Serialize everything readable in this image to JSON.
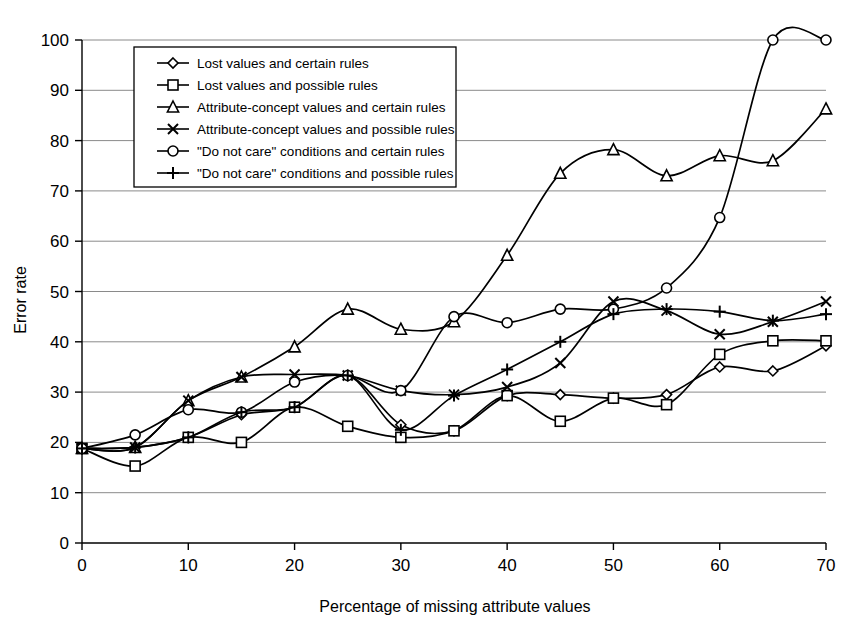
{
  "chart_data": {
    "type": "line",
    "title": "",
    "xlabel": "Percentage of missing attribute values",
    "ylabel": "Error rate",
    "xlim": [
      0,
      70
    ],
    "ylim": [
      0,
      100
    ],
    "xticks": [
      0,
      10,
      20,
      30,
      40,
      50,
      60,
      70
    ],
    "yticks": [
      0,
      10,
      20,
      30,
      40,
      50,
      60,
      70,
      80,
      90,
      100
    ],
    "grid": "horizontal",
    "legend_position": "upper-left-inside",
    "x": [
      0,
      5,
      10,
      15,
      20,
      25,
      30,
      35,
      40,
      45,
      50,
      55,
      60,
      65,
      70
    ],
    "series": [
      {
        "name": "Lost values and certain rules",
        "marker": "diamond",
        "values": [
          18.8,
          19.0,
          21.0,
          25.5,
          27.0,
          33.3,
          23.5,
          22.3,
          29.3,
          29.5,
          28.8,
          29.5,
          35.0,
          34.2,
          39.2
        ]
      },
      {
        "name": "Lost values and possible rules",
        "marker": "square",
        "values": [
          18.8,
          15.3,
          21.0,
          20.0,
          27.0,
          23.2,
          21.0,
          22.3,
          29.3,
          24.2,
          28.8,
          27.5,
          37.5,
          40.2,
          40.2
        ]
      },
      {
        "name": "Attribute-concept values and certain rules",
        "marker": "triangle",
        "values": [
          18.8,
          19.0,
          28.3,
          33.0,
          39.0,
          46.5,
          42.5,
          44.0,
          57.2,
          73.5,
          78.2,
          73.0,
          77.0,
          76.0,
          86.3
        ]
      },
      {
        "name": "Attribute-concept values and possible rules",
        "marker": "cross",
        "values": [
          18.8,
          19.0,
          28.3,
          33.0,
          33.5,
          33.3,
          30.3,
          29.5,
          31.0,
          35.8,
          48.0,
          46.2,
          41.5,
          44.0,
          48.0
        ]
      },
      {
        "name": "\"Do not care\" conditions and certain rules",
        "marker": "circle",
        "values": [
          18.8,
          21.5,
          26.5,
          26.0,
          32.0,
          33.3,
          30.3,
          45.0,
          43.8,
          46.5,
          46.5,
          50.7,
          64.7,
          100.0,
          100.0
        ]
      },
      {
        "name": "\"Do not care\" conditions and possible rules",
        "marker": "plus",
        "values": [
          18.8,
          19.0,
          21.0,
          26.0,
          27.0,
          33.3,
          22.5,
          29.3,
          34.5,
          40.0,
          45.5,
          46.5,
          46.0,
          44.2,
          45.5
        ]
      }
    ]
  }
}
